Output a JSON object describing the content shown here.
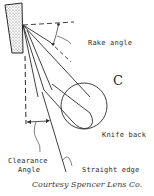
{
  "diagram": {
    "type": "microtome knife angle illustration",
    "labels": {
      "rake_angle": "Rake angle",
      "region": "C",
      "knife_back": "Knife back",
      "clearance_angle_line1": "Clearance",
      "clearance_angle_line2": "Angle",
      "straight_edge": "Straight edge"
    },
    "credit": "Courtesy Spencer Lens Co.",
    "colors": {
      "ink": "#2a2a2a",
      "background": "#ffffff",
      "block_fill": "#d8d8d8"
    }
  }
}
